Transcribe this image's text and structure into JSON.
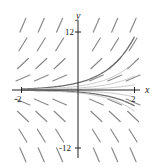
{
  "figure": {
    "type": "slope-field",
    "x_axis": {
      "label": "x",
      "ticks": [
        {
          "value": -2,
          "label": "-2"
        },
        {
          "value": 2,
          "label": "2"
        }
      ],
      "range": [
        -2,
        2
      ]
    },
    "y_axis": {
      "label": "y",
      "ticks": [
        {
          "value": 12,
          "label": "12"
        },
        {
          "value": -12,
          "label": "-12"
        }
      ],
      "range": [
        -12,
        12
      ]
    },
    "colors": {
      "axis": "#222222",
      "segments": "#8a8a8a",
      "curves": "#6e6e6e",
      "faint_curves": "#c8c8c8"
    },
    "layout": {
      "origin_px": [
        78,
        90
      ],
      "px_per_x": 28.25,
      "px_per_y": 4.8
    },
    "grid": {
      "x_values": [
        -1.95,
        -1.3,
        -0.65,
        0.65,
        1.3,
        1.95
      ],
      "y_values": [
        13.5,
        9.5,
        5.5,
        2.5,
        -2.5,
        -5.5,
        -9.5,
        -13.5
      ]
    },
    "solution_curves": [
      {
        "c": 1.5,
        "style": "dark"
      },
      {
        "c": 0.8,
        "style": "faint"
      },
      {
        "c": 0.4,
        "style": "faint"
      },
      {
        "c": 0.15,
        "style": "faint"
      },
      {
        "c": -0.2,
        "style": "faint"
      },
      {
        "c": -0.45,
        "style": "dark"
      },
      {
        "c": -0.6,
        "style": "faint"
      }
    ]
  }
}
